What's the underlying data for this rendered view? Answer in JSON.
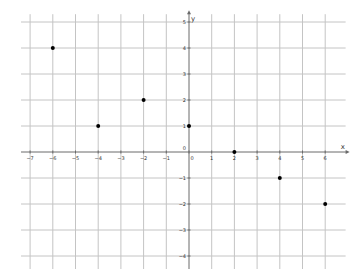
{
  "chart_data": {
    "type": "scatter",
    "title": "",
    "xlabel": "x",
    "ylabel": "y",
    "xlim": [
      -7.4,
      6.9
    ],
    "ylim": [
      -4.5,
      5.3
    ],
    "grid": true,
    "x_ticks": [
      -7,
      -6,
      -5,
      -4,
      -3,
      -2,
      -1,
      0,
      1,
      2,
      3,
      4,
      5,
      6
    ],
    "y_ticks": [
      5,
      4,
      3,
      2,
      1,
      0,
      -1,
      -2,
      -3,
      -4
    ],
    "series": [
      {
        "name": "points",
        "color": "#000000",
        "points": [
          {
            "x": -6,
            "y": 4
          },
          {
            "x": -4,
            "y": 1
          },
          {
            "x": -2,
            "y": 2
          },
          {
            "x": 0,
            "y": 1
          },
          {
            "x": 2,
            "y": 0
          },
          {
            "x": 4,
            "y": -1
          },
          {
            "x": 6,
            "y": -2
          }
        ]
      }
    ]
  }
}
